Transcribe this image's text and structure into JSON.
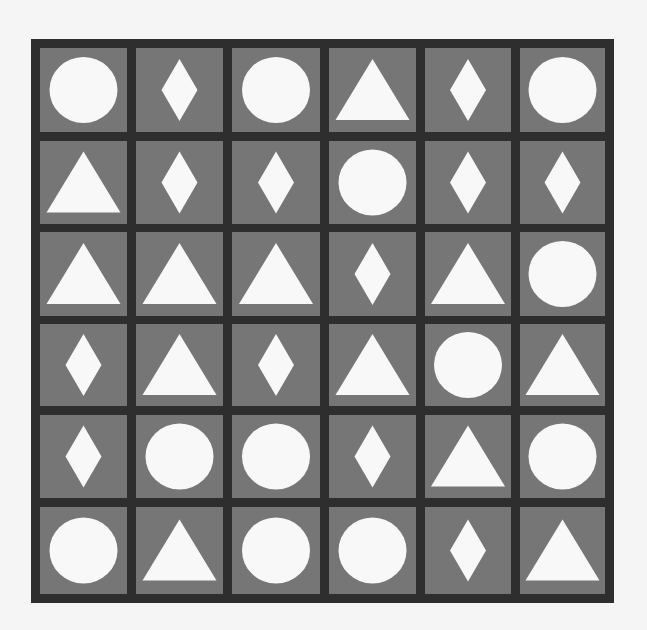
{
  "colors": {
    "page_background": "#f5f5f5",
    "board_border": "#2e2e2e",
    "cell_fill": "#767676",
    "shape_fill": "#f8f8f8"
  },
  "board": {
    "rows": 6,
    "cols": 6,
    "grid": [
      [
        "circle",
        "diamond",
        "circle",
        "triangle",
        "diamond",
        "circle"
      ],
      [
        "triangle",
        "diamond",
        "diamond",
        "circle",
        "diamond",
        "diamond"
      ],
      [
        "triangle",
        "triangle",
        "triangle",
        "diamond",
        "triangle",
        "circle"
      ],
      [
        "diamond",
        "triangle",
        "diamond",
        "triangle",
        "circle",
        "triangle"
      ],
      [
        "diamond",
        "circle",
        "circle",
        "diamond",
        "triangle",
        "circle"
      ],
      [
        "circle",
        "triangle",
        "circle",
        "circle",
        "diamond",
        "triangle"
      ]
    ],
    "counts": {
      "circle": 12,
      "diamond": 12,
      "triangle": 12
    }
  },
  "icons": {
    "circle": "circle-icon",
    "diamond": "diamond-icon",
    "triangle": "triangle-icon"
  }
}
